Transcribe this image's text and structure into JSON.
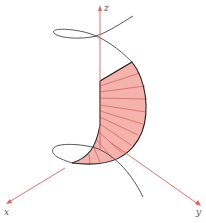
{
  "figure": {
    "type": "3d-parametric-surface-diagram",
    "axes": {
      "x_label": "x",
      "y_label": "y",
      "z_label": "z"
    },
    "colors": {
      "axis": "#e0605a",
      "surface_fill": "#f4b3ad",
      "surface_rule": "#d9665e",
      "surface_edge": "#222222",
      "curve": "#444444",
      "background": "#ffffff"
    },
    "elements": [
      "z-axis arrow (vertical, pointing up)",
      "x-axis arrow (pointing lower-left)",
      "y-axis arrow (pointing lower-right)",
      "helical space curve with upper and lower loops",
      "shaded ruled surface between z-axis and curve"
    ]
  }
}
